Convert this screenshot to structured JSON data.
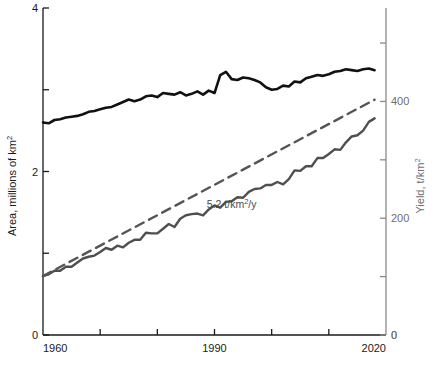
{
  "chart_data": {
    "type": "line",
    "title": "",
    "xlabel": "",
    "xlim": [
      1960,
      2020
    ],
    "x_ticks": [
      1960,
      1970,
      1980,
      1990,
      2000,
      2010,
      2020
    ],
    "x_tick_labels": [
      "1960",
      "",
      "",
      "1990",
      "",
      "",
      "2020"
    ],
    "grid": false,
    "legend": "none",
    "axes": [
      {
        "id": "left",
        "label": "Area, millions of km",
        "label_sup": "2",
        "unit": "millions of km^2",
        "ylim": [
          0,
          4
        ],
        "ticks": [
          0,
          1,
          2,
          3,
          4
        ],
        "tick_labels": [
          "0",
          "",
          "2",
          "",
          "4"
        ],
        "color": "#1a1a1a"
      },
      {
        "id": "right",
        "label": "Yield, t/km",
        "label_sup": "2",
        "unit": "t/km^2",
        "ylim": [
          0,
          560
        ],
        "ticks": [
          0,
          100,
          200,
          300,
          400,
          500
        ],
        "tick_labels": [
          "0",
          "",
          "200",
          "",
          "400",
          ""
        ],
        "color": "#6e6e6e"
      }
    ],
    "annotations": [
      {
        "text": "5.2 t/km",
        "sup": "2",
        "suffix": "/y",
        "full_text": "5.2 t/km2/y",
        "x": 1993,
        "y": 218,
        "axis": "right",
        "color": "#4a4a4a"
      }
    ],
    "series": [
      {
        "name": "Area harvested",
        "axis": "left",
        "color": "#111111",
        "style": "solid",
        "width": 2.6,
        "x": [
          1960,
          1961,
          1962,
          1963,
          1964,
          1965,
          1966,
          1967,
          1968,
          1969,
          1970,
          1971,
          1972,
          1973,
          1974,
          1975,
          1976,
          1977,
          1978,
          1979,
          1980,
          1981,
          1982,
          1983,
          1984,
          1985,
          1986,
          1987,
          1988,
          1989,
          1990,
          1991,
          1992,
          1993,
          1994,
          1995,
          1996,
          1997,
          1998,
          1999,
          2000,
          2001,
          2002,
          2003,
          2004,
          2005,
          2006,
          2007,
          2008,
          2009,
          2010,
          2011,
          2012,
          2013,
          2014,
          2015,
          2016,
          2017,
          2018
        ],
        "values": [
          2.6,
          2.59,
          2.63,
          2.64,
          2.66,
          2.67,
          2.68,
          2.7,
          2.73,
          2.74,
          2.76,
          2.78,
          2.79,
          2.82,
          2.85,
          2.88,
          2.86,
          2.88,
          2.92,
          2.93,
          2.91,
          2.96,
          2.95,
          2.94,
          2.97,
          2.93,
          2.95,
          2.98,
          2.94,
          2.99,
          2.96,
          3.18,
          3.22,
          3.13,
          3.12,
          3.15,
          3.14,
          3.12,
          3.09,
          3.03,
          3.0,
          3.01,
          3.05,
          3.04,
          3.1,
          3.09,
          3.14,
          3.16,
          3.18,
          3.17,
          3.19,
          3.22,
          3.23,
          3.25,
          3.24,
          3.23,
          3.25,
          3.26,
          3.24
        ]
      },
      {
        "name": "Yield",
        "axis": "right",
        "color": "#4f4f4f",
        "style": "solid",
        "width": 2.4,
        "x": [
          1960,
          1961,
          1962,
          1963,
          1964,
          1965,
          1966,
          1967,
          1968,
          1969,
          1970,
          1971,
          1972,
          1973,
          1974,
          1975,
          1976,
          1977,
          1978,
          1979,
          1980,
          1981,
          1982,
          1983,
          1984,
          1985,
          1986,
          1987,
          1988,
          1989,
          1990,
          1991,
          1992,
          1993,
          1994,
          1995,
          1996,
          1997,
          1998,
          1999,
          2000,
          2001,
          2002,
          2003,
          2004,
          2005,
          2006,
          2007,
          2008,
          2009,
          2010,
          2011,
          2012,
          2013,
          2014,
          2015,
          2016,
          2017,
          2018
        ],
        "values": [
          101,
          104,
          110,
          110,
          117,
          117,
          124,
          131,
          134,
          136,
          142,
          149,
          146,
          153,
          150,
          158,
          163,
          163,
          175,
          174,
          174,
          182,
          190,
          185,
          199,
          205,
          207,
          208,
          205,
          215,
          222,
          218,
          228,
          229,
          236,
          235,
          245,
          250,
          251,
          257,
          257,
          262,
          258,
          267,
          282,
          281,
          289,
          289,
          303,
          303,
          310,
          318,
          317,
          330,
          340,
          342,
          350,
          365,
          371
        ]
      },
      {
        "name": "Yield trend (5.2 t/km2/y)",
        "axis": "right",
        "color": "#555555",
        "style": "dashed",
        "width": 2.4,
        "x": [
          1960,
          2018
        ],
        "values": [
          101,
          403
        ]
      }
    ]
  }
}
